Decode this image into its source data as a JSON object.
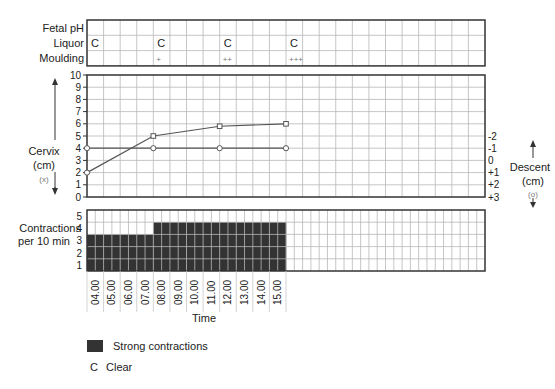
{
  "chart_data": [
    {
      "type": "table",
      "title": "Partograph observations",
      "rows": [
        "Fetal pH",
        "Liquor",
        "Moulding"
      ],
      "entries": [
        {
          "row": "Liquor",
          "hour_index": 0,
          "value": "C"
        },
        {
          "row": "Liquor",
          "hour_index": 4,
          "value": "C"
        },
        {
          "row": "Liquor",
          "hour_index": 8,
          "value": "C"
        },
        {
          "row": "Liquor",
          "hour_index": 12,
          "value": "C"
        },
        {
          "row": "Moulding",
          "hour_index": 4,
          "value": "+"
        },
        {
          "row": "Moulding",
          "hour_index": 8,
          "value": "++"
        },
        {
          "row": "Moulding",
          "hour_index": 12,
          "value": "+++"
        }
      ]
    },
    {
      "type": "line",
      "ylabel_left": "Cervix (cm)",
      "ylabel_left_marker": "(x)",
      "ylabel_right": "Descent (cm)",
      "ylabel_right_marker": "(o)",
      "ylim": [
        0,
        10
      ],
      "y_ticks": [
        "0",
        "1",
        "2",
        "3",
        "4",
        "5",
        "6",
        "7",
        "8",
        "9",
        "10"
      ],
      "right_ticks": [
        {
          "label": "-2",
          "y": 5
        },
        {
          "label": "-1",
          "y": 4
        },
        {
          "label": "0",
          "y": 3
        },
        {
          "label": "+1",
          "y": 2
        },
        {
          "label": "+2",
          "y": 1
        },
        {
          "label": "+3",
          "y": 0
        }
      ],
      "x_hour_offsets": [
        0,
        4,
        8,
        12
      ],
      "series": [
        {
          "name": "Cervix",
          "values": [
            2,
            5,
            5.8,
            6
          ]
        },
        {
          "name": "Descent",
          "values": [
            4,
            4,
            4,
            4
          ]
        }
      ]
    },
    {
      "type": "bar",
      "ylabel": "Contractions per 10 min",
      "ylim": [
        0,
        5
      ],
      "y_ticks": [
        "1",
        "2",
        "3",
        "4",
        "5"
      ],
      "categories": [
        "04.00",
        "05.00",
        "06.00",
        "07.00",
        "08.00",
        "09.00",
        "10.00",
        "11.00",
        "12.00",
        "13.00",
        "14.00",
        "15.00"
      ],
      "values": [
        3,
        3,
        3,
        3,
        4,
        4,
        4,
        4,
        4,
        4,
        4,
        4
      ],
      "xlabel": "Time",
      "fill_color": "#333333"
    }
  ],
  "labels": {
    "fetal_ph": "Fetal pH",
    "liquor": "Liquor",
    "moulding": "Moulding",
    "cervix": "Cervix",
    "cervix_unit": "(cm)",
    "cervix_marker": "(x)",
    "descent": "Descent",
    "descent_unit": "(cm)",
    "descent_marker": "(o)",
    "contractions_1": "Contractions",
    "contractions_2": "per 10 min",
    "time": "Time"
  },
  "legend": {
    "strong_contractions": "Strong contractions",
    "clear_symbol": "C",
    "clear_label": "Clear"
  }
}
